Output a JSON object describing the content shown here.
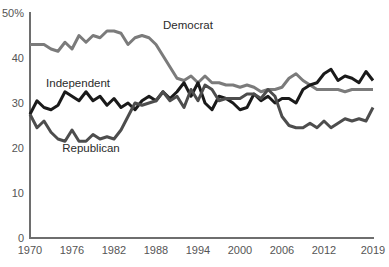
{
  "chart_data": {
    "type": "line",
    "title": "",
    "subtitle": "",
    "xlabel": "",
    "ylabel": "",
    "xlim": [
      1970,
      2019
    ],
    "ylim": [
      0,
      50
    ],
    "grid": false,
    "legend_position": "inline-annotations",
    "y_ticks": [
      {
        "value": 50,
        "label": "50%"
      },
      {
        "value": 40,
        "label": "40"
      },
      {
        "value": 30,
        "label": "30"
      },
      {
        "value": 20,
        "label": "20"
      },
      {
        "value": 10,
        "label": "10"
      },
      {
        "value": 0,
        "label": "0"
      }
    ],
    "x_ticks": [
      {
        "value": 1970,
        "label": "1970"
      },
      {
        "value": 1976,
        "label": "1976"
      },
      {
        "value": 1982,
        "label": "1982"
      },
      {
        "value": 1988,
        "label": "1988"
      },
      {
        "value": 1994,
        "label": "1994"
      },
      {
        "value": 2000,
        "label": "2000"
      },
      {
        "value": 2006,
        "label": "2006"
      },
      {
        "value": 2012,
        "label": "2012"
      },
      {
        "value": 2019,
        "label": "2019"
      }
    ],
    "x": [
      1970,
      1971,
      1972,
      1973,
      1974,
      1975,
      1976,
      1977,
      1978,
      1979,
      1980,
      1981,
      1982,
      1983,
      1984,
      1985,
      1986,
      1987,
      1988,
      1989,
      1990,
      1991,
      1992,
      1993,
      1994,
      1995,
      1996,
      1997,
      1998,
      1999,
      2000,
      2001,
      2002,
      2003,
      2004,
      2005,
      2006,
      2007,
      2008,
      2009,
      2010,
      2011,
      2012,
      2013,
      2014,
      2015,
      2016,
      2017,
      2018,
      2019
    ],
    "series": [
      {
        "name": "Democrat",
        "color": "#7b7b7b",
        "label_x": 1989,
        "label_y": 46.5,
        "values": [
          43,
          43,
          43,
          42,
          41.5,
          43.5,
          42,
          45,
          43.5,
          45,
          44.5,
          46,
          46,
          45.5,
          43,
          44.5,
          45,
          44.5,
          43,
          40.5,
          38,
          35.5,
          35,
          36,
          34.5,
          36,
          34.5,
          34.5,
          34,
          34,
          33.5,
          34,
          33.5,
          32.5,
          33,
          33,
          33.5,
          35.5,
          36.5,
          35,
          34,
          33,
          33,
          33,
          33,
          32.5,
          33,
          33,
          33,
          33
        ]
      },
      {
        "name": "Independent",
        "color": "#1a1a1a",
        "label_x": 1972.3,
        "label_y": 33.5,
        "values": [
          27.5,
          30.5,
          29,
          28.5,
          29.5,
          32.5,
          31.5,
          30.5,
          32.5,
          30.5,
          31.5,
          29.5,
          31,
          29,
          30,
          28.5,
          30.5,
          31.5,
          30.5,
          32.5,
          31,
          32.5,
          34.5,
          31.5,
          34.5,
          30,
          28.5,
          31.5,
          31,
          30,
          28.5,
          29,
          32,
          30.5,
          31.5,
          30,
          31,
          31,
          30,
          33,
          34,
          34.5,
          36.5,
          37.5,
          35,
          36,
          35.5,
          34.5,
          37,
          35
        ]
      },
      {
        "name": "Republican",
        "color": "#4d4d4d",
        "label_x": 1974.6,
        "label_y": 19.2,
        "values": [
          27.5,
          24.5,
          26,
          23.5,
          22,
          21.5,
          24,
          21.5,
          21.5,
          23,
          22,
          22.5,
          22,
          24,
          27,
          30,
          29.5,
          30,
          30.5,
          32.5,
          30.5,
          31.5,
          29,
          33,
          30.5,
          34,
          33,
          30.5,
          31,
          31,
          31,
          32,
          32,
          31,
          33,
          31.5,
          27,
          25,
          24.5,
          24.5,
          25.5,
          24.5,
          26,
          24.5,
          25.5,
          26.5,
          26,
          26.5,
          26,
          29
        ]
      }
    ]
  }
}
